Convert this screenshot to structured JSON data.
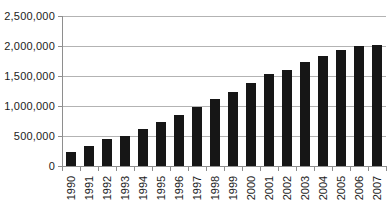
{
  "chart_data": {
    "type": "bar",
    "categories": [
      "1990",
      "1991",
      "1992",
      "1993",
      "1994",
      "1995",
      "1996",
      "1997",
      "1998",
      "1999",
      "2000",
      "2001",
      "2002",
      "2003",
      "2004",
      "2005",
      "2006",
      "2007"
    ],
    "values": [
      230000,
      335000,
      445000,
      500000,
      610000,
      740000,
      850000,
      990000,
      1110000,
      1230000,
      1390000,
      1530000,
      1600000,
      1740000,
      1830000,
      1930000,
      2000000,
      2020000
    ],
    "xlabel": "",
    "ylabel": "",
    "ylim": [
      0,
      2500000
    ],
    "ytick_interval": 500000,
    "yticks": [
      0,
      500000,
      1000000,
      1500000,
      2000000,
      2500000
    ],
    "ytick_labels": [
      "0",
      "500,000",
      "1,000,000",
      "1,500,000",
      "2,000,000",
      "2,500,000"
    ],
    "grid": "horizontal",
    "legend": "none",
    "x_label_rotation_degrees": 90,
    "colors": {
      "bar": "#161616",
      "gridline": "#b3b3b3",
      "axis": "#8e8e8e",
      "text": "#1c1c1c",
      "background": "#ffffff"
    }
  }
}
